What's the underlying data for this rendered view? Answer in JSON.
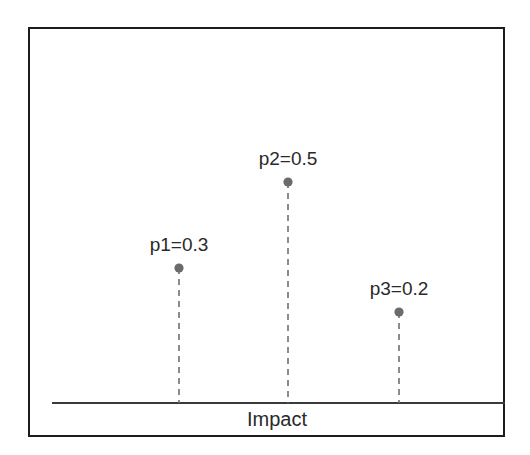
{
  "figure": {
    "background_color": "#ffffff",
    "frame": {
      "x": 28,
      "y": 27,
      "width": 477,
      "height": 410,
      "border_color": "#1c1c1c",
      "border_width": 2.5
    }
  },
  "chart_data": {
    "type": "scatter",
    "title": "",
    "subtitle": "",
    "xlabel": "Impact",
    "ylabel": "",
    "grid": false,
    "legend": null,
    "axis": {
      "baseline_y_px": 403,
      "baseline_x_start_px": 52,
      "baseline_x_end_px": 505,
      "baseline_color": "#3a3a3a",
      "baseline_width": 1.8,
      "ticks": [],
      "tick_labels": []
    },
    "marker_style": {
      "shape": "circle",
      "color": "#6b6b6b",
      "radius_px": 4.6
    },
    "stem_style": {
      "color": "#6f6f6f",
      "width": 1.6,
      "dash": "6 5"
    },
    "categories": [
      "p1",
      "p2",
      "p3"
    ],
    "values": [
      0.3,
      0.5,
      0.2
    ],
    "points": [
      {
        "name": "p1",
        "value": 0.3,
        "label": "p1=0.3",
        "x_px": 179,
        "y_px": 268,
        "label_x_px": 179,
        "label_y_px": 234
      },
      {
        "name": "p2",
        "value": 0.5,
        "label": "p2=0.5",
        "x_px": 288,
        "y_px": 182,
        "label_x_px": 288,
        "label_y_px": 148
      },
      {
        "name": "p3",
        "value": 0.2,
        "label": "p3=0.2",
        "x_px": 399,
        "y_px": 312,
        "label_x_px": 399,
        "label_y_px": 278
      }
    ],
    "axis_label_position": {
      "x_px": 277,
      "y_px": 408
    }
  }
}
